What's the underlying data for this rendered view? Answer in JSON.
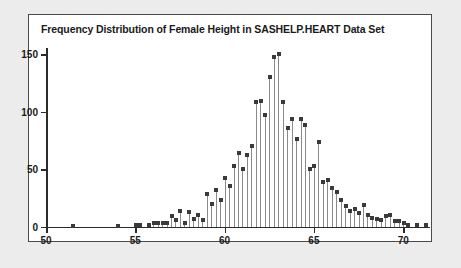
{
  "figure": {
    "title": "Frequency Distribution of Female Height in SASHELP.HEART Data Set",
    "background": "#ffffff",
    "page_background": "#ececed",
    "border_color": "#4a4a4a",
    "needle_color": "#8a8a8a",
    "marker_color": "#3a3a3a"
  },
  "chart_data": {
    "type": "bar",
    "title": "Frequency Distribution of Female Height in SASHELP.HEART Data Set",
    "subtitle": "",
    "xlabel": "",
    "ylabel": "",
    "grid": false,
    "legend": false,
    "style": "needle-plot",
    "xlim": [
      50,
      71.5
    ],
    "ylim": [
      0,
      155
    ],
    "xticks": [
      50,
      55,
      60,
      65,
      70
    ],
    "yticks": [
      0,
      50,
      100,
      150
    ],
    "xtick_labels": [
      "50",
      "55",
      "60",
      "65",
      "70"
    ],
    "ytick_labels": [
      "0",
      "50",
      "100",
      "150"
    ],
    "x": [
      51.5,
      54.0,
      55.0,
      55.25,
      55.75,
      56.0,
      56.25,
      56.5,
      56.75,
      57.0,
      57.25,
      57.5,
      57.75,
      58.0,
      58.25,
      58.5,
      58.75,
      59.0,
      59.25,
      59.5,
      59.75,
      60.0,
      60.25,
      60.5,
      60.75,
      61.0,
      61.25,
      61.5,
      61.75,
      62.0,
      62.25,
      62.5,
      62.75,
      63.0,
      63.25,
      63.5,
      63.75,
      64.0,
      64.25,
      64.5,
      64.75,
      65.0,
      65.25,
      65.5,
      65.75,
      66.0,
      66.25,
      66.5,
      66.75,
      67.0,
      67.25,
      67.5,
      67.75,
      68.0,
      68.25,
      68.5,
      68.75,
      69.0,
      69.25,
      69.5,
      69.75,
      70.0,
      70.25,
      70.75,
      71.25
    ],
    "values": [
      1,
      1,
      2,
      2,
      2,
      3,
      3,
      3,
      3,
      9,
      5,
      13,
      3,
      12,
      6,
      10,
      5,
      28,
      19,
      31,
      23,
      42,
      35,
      52,
      64,
      50,
      62,
      70,
      108,
      109,
      97,
      130,
      147,
      150,
      108,
      85,
      93,
      76,
      93,
      88,
      50,
      52,
      73,
      38,
      40,
      33,
      30,
      23,
      17,
      13,
      15,
      11,
      18,
      10,
      7,
      6,
      5,
      9,
      10,
      4,
      4,
      3,
      2,
      2,
      2
    ],
    "peak": {
      "x": 63.0,
      "y": 150
    }
  }
}
